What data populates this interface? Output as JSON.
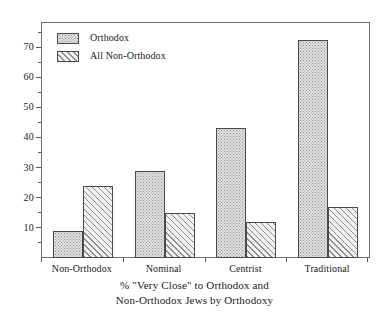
{
  "chart_data": {
    "type": "bar",
    "title": "",
    "caption_lines": [
      "% \"Very Close\" to Orthodox and",
      "Non-Orthodox Jews by Orthodoxy"
    ],
    "categories": [
      "Non-Orthodox",
      "Nominal",
      "Centrist",
      "Traditional"
    ],
    "series": [
      {
        "name": "Orthodox",
        "values": [
          9,
          29,
          43,
          72.5
        ],
        "pattern": "dotted"
      },
      {
        "name": "All Non-Orthodox",
        "values": [
          24,
          15,
          12,
          17
        ],
        "pattern": "hatched"
      }
    ],
    "xlabel": "",
    "ylabel": "",
    "ylim": [
      0,
      78
    ],
    "y_major_ticks": [
      10,
      20,
      30,
      40,
      50,
      60,
      70
    ],
    "y_minor_ticks": [
      5,
      15,
      25,
      35,
      45,
      55,
      65,
      75
    ],
    "y_tick_labels": [
      "10",
      "20",
      "30",
      "40",
      "50",
      "60",
      "70"
    ],
    "grid": false,
    "legend": {
      "position": "top-left",
      "entries": [
        "Orthodox",
        "All Non-Orthodox"
      ]
    },
    "colors": {
      "frame": "#6e6e6e",
      "bar_outline": "#4a4a4a",
      "pattern_ink": "#8d8d8d",
      "dotted_fill": "#e3e3e3",
      "hatched_fill": "#f2f2f2",
      "background": "#ffffff",
      "text": "#1a1a1a"
    }
  }
}
